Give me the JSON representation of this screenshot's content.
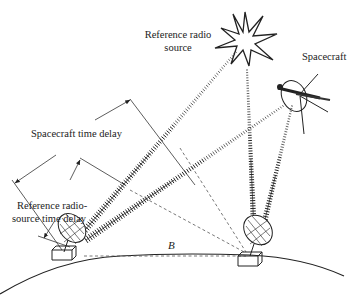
{
  "diagram": {
    "labels": {
      "reference_source": [
        "Reference radio",
        "source"
      ],
      "spacecraft": "Spacecraft",
      "spacecraft_delay": "Spacecraft time delay",
      "reference_delay": [
        "Reference radio-",
        "source time delay"
      ],
      "baseline": "B"
    },
    "colors": {
      "ink": "#222222",
      "background": "#ffffff"
    }
  }
}
